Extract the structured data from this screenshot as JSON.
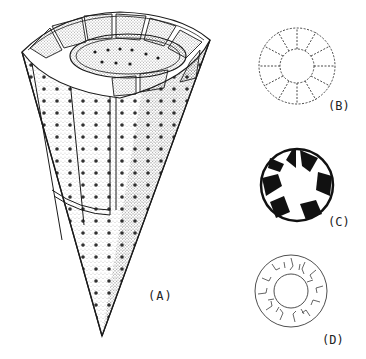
{
  "figure": {
    "panels": [
      {
        "id": "A",
        "label": "(A)",
        "description": "cone-shaped structure with perforated walls and internal compartments"
      },
      {
        "id": "B",
        "label": "(B)",
        "description": "cross-section ring with dashed outline, 12 segments"
      },
      {
        "id": "C",
        "label": "(C)",
        "description": "cross-section ring with solid black wall fragments"
      },
      {
        "id": "D",
        "label": "(D)",
        "description": "cross-section ring with irregular fibrous texture"
      }
    ],
    "colors": {
      "ink": "#1a1a1a",
      "paper": "#ffffff"
    }
  }
}
